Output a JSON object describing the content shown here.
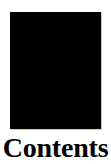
{
  "page": {
    "background_color": "#ffffff",
    "width": 111,
    "height": 164
  },
  "cover": {
    "name": "cover-plate",
    "fill_color": "#000000",
    "edge_color": "#c9c9c9"
  },
  "caption": {
    "text": "Contents",
    "color": "#000000"
  }
}
